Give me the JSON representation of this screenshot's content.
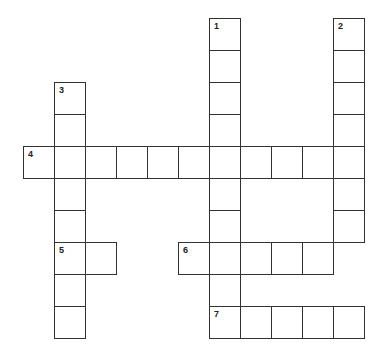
{
  "puzzle": {
    "cell_width": 31,
    "cell_height": 32,
    "origin_x": 23,
    "origin_y": 18,
    "entries": [
      {
        "number": "1",
        "direction": "down",
        "row": 0,
        "col": 6,
        "length": 10
      },
      {
        "number": "2",
        "direction": "down",
        "row": 0,
        "col": 10,
        "length": 7
      },
      {
        "number": "3",
        "direction": "down",
        "row": 2,
        "col": 1,
        "length": 8
      },
      {
        "number": "4",
        "direction": "across",
        "row": 4,
        "col": 0,
        "length": 11
      },
      {
        "number": "5",
        "direction": "across",
        "row": 7,
        "col": 1,
        "length": 2
      },
      {
        "number": "6",
        "direction": "across",
        "row": 7,
        "col": 5,
        "length": 5
      },
      {
        "number": "7",
        "direction": "across",
        "row": 9,
        "col": 6,
        "length": 5
      }
    ]
  }
}
